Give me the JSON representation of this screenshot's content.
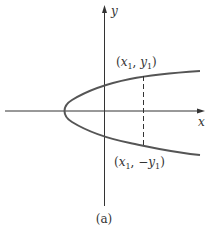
{
  "figure": {
    "caption": "(a)",
    "axes": {
      "x_label": "x",
      "y_label": "y"
    },
    "points": {
      "upper": {
        "open": "(",
        "x": "x",
        "x_sub": "1",
        "sep": ", ",
        "y": "y",
        "y_sub": "1",
        "close": ")"
      },
      "lower": {
        "open": "(",
        "x": "x",
        "x_sub": "1",
        "sep": ", ",
        "neg": "−",
        "y": "y",
        "y_sub": "1",
        "close": ")"
      }
    },
    "colors": {
      "axis": "#333333",
      "curve": "#555555",
      "dashed": "#333333"
    }
  }
}
